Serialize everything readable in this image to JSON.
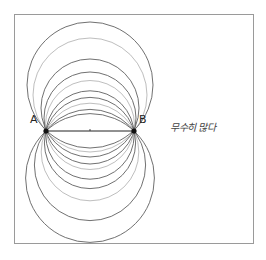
{
  "diagram": {
    "points": [
      {
        "label": "A",
        "x": 46,
        "y": 131
      },
      {
        "label": "B",
        "x": 134,
        "y": 131
      }
    ],
    "segment": {
      "from": "A",
      "to": "B",
      "midpoint_mark": true
    },
    "circles_through_AB": [
      {
        "cx": 90,
        "cy": 85,
        "r": 63
      },
      {
        "cx": 90,
        "cy": 95,
        "r": 57
      },
      {
        "cx": 90,
        "cy": 108,
        "r": 49
      },
      {
        "cx": 90,
        "cy": 118,
        "r": 46
      },
      {
        "cx": 90,
        "cy": 125,
        "r": 44.5
      },
      {
        "cx": 90,
        "cy": 135,
        "r": 44.2
      },
      {
        "cx": 90,
        "cy": 143,
        "r": 45.6
      },
      {
        "cx": 90,
        "cy": 152,
        "r": 48.8
      },
      {
        "cx": 90,
        "cy": 165,
        "r": 55.6
      },
      {
        "cx": 90,
        "cy": 178,
        "r": 64.4
      }
    ],
    "annotation": "무수히 많다",
    "stroke_color": "#3a3a3a",
    "frame_color": "#9a9a9a"
  }
}
